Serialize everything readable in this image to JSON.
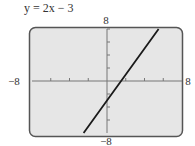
{
  "chart_data": {
    "type": "line",
    "title": "y = 2x − 3",
    "equation": "y = 2x - 3",
    "xlabel": "",
    "ylabel": "",
    "xlim": [
      -8,
      8
    ],
    "ylim": [
      -8,
      8
    ],
    "x_tick_step": 2,
    "y_tick_step": 2,
    "grid": false,
    "legend": null,
    "tick_labels": {
      "xmin": "−8",
      "xmax": "8",
      "ymin": "−8",
      "ymax": "8"
    },
    "series": [
      {
        "name": "y = 2x − 3",
        "color": "#1a1a1a",
        "x": [
          -2.5,
          0,
          1.5,
          5.5
        ],
        "y": [
          -8,
          -3,
          0,
          8
        ]
      }
    ]
  },
  "style": {
    "frame_color": "#555555",
    "screen_fill": "#e6e6e6",
    "axis_color": "#777777",
    "line_color": "#1a1a1a"
  }
}
